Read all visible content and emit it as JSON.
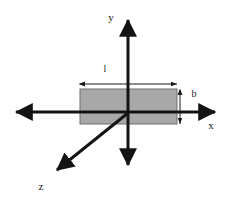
{
  "figure": {
    "background_color": "#ffffff"
  },
  "axes": {
    "stroke_color": "#141414",
    "stroke_width": 3,
    "origin": {
      "x": 128,
      "y": 113
    },
    "items": [
      {
        "name": "y-axis",
        "label": "y",
        "label_x": 111,
        "label_y": 21,
        "direction": "vertical",
        "arrowheads": "both",
        "x1": 128,
        "y1": 17,
        "x2": 128,
        "y2": 168
      },
      {
        "name": "x-axis",
        "label": "x",
        "label_x": 211,
        "label_y": 129,
        "direction": "horizontal",
        "arrowheads": "both",
        "x1": 13,
        "y1": 112,
        "x2": 218,
        "y2": 112
      },
      {
        "name": "z-axis",
        "label": "z",
        "label_x": 41,
        "label_y": 190,
        "direction": "diagonal",
        "arrowheads": "one",
        "x1": 128,
        "y1": 113,
        "x2": 53,
        "y2": 173
      }
    ]
  },
  "plate": {
    "name": "rectangular-plate",
    "fill_color": "#a8a8a8",
    "stroke_color": "#6e6e6e",
    "x": 80,
    "y": 89,
    "width": 97,
    "height": 35
  },
  "dimensions": [
    {
      "name": "length-dimension",
      "label": "l",
      "label_x": 105,
      "label_y": 72,
      "orientation": "horizontal",
      "line_y": 84,
      "x1": 80,
      "x2": 177,
      "stroke_color": "#1a1a1a"
    },
    {
      "name": "breadth-dimension",
      "label": "b",
      "label_x": 194,
      "label_y": 97,
      "orientation": "vertical",
      "line_x": 180,
      "y1": 90,
      "y2": 124,
      "stroke_color": "#1a1a1a"
    }
  ]
}
